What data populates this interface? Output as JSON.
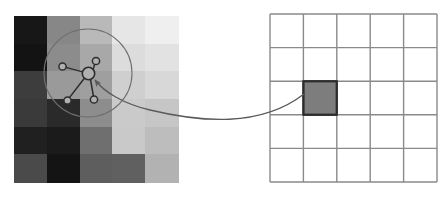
{
  "figure": {
    "title": "Pixel neighbourhood graph mapped to lattice cell",
    "width": 448,
    "height": 197,
    "background_color": "#ffffff"
  },
  "palette": {
    "stroke_dark": "#3a3a3a",
    "stroke_grid": "#808080",
    "node_fill": "#b4b4b4",
    "highlight_fill": "#7d7d7d",
    "highlight_stroke": "#2b2b2b",
    "lens_stroke": "#6e6e6e",
    "connector_stroke": "#5a5a5a"
  },
  "pixel_grid": {
    "label": "grayscale pixel patch",
    "x": 14,
    "y": 16,
    "cell_width": 32.8,
    "cell_height": 27.67,
    "columns": 5,
    "rows": 6,
    "cells": [
      [
        {
          "name": "px-r1c1",
          "color": "#171717"
        },
        {
          "name": "px-r1c2",
          "color": "#878787"
        },
        {
          "name": "px-r1c3",
          "color": "#b9b9b9"
        },
        {
          "name": "px-r1c4",
          "color": "#e6e6e6"
        },
        {
          "name": "px-r1c5",
          "color": "#efefef"
        }
      ],
      [
        {
          "name": "px-r2c1",
          "color": "#131313"
        },
        {
          "name": "px-r2c2",
          "color": "#8c8c8c"
        },
        {
          "name": "px-r2c3",
          "color": "#a8a8a8"
        },
        {
          "name": "px-r2c4",
          "color": "#dcdcdc"
        },
        {
          "name": "px-r2c5",
          "color": "#e2e2e2"
        }
      ],
      [
        {
          "name": "px-r3c1",
          "color": "#3d3d3d"
        },
        {
          "name": "px-r3c2",
          "color": "#9a9a9a"
        },
        {
          "name": "px-r3c3",
          "color": "#9f9f9f"
        },
        {
          "name": "px-r3c4",
          "color": "#cfcfcf"
        },
        {
          "name": "px-r3c5",
          "color": "#d8d8d8"
        }
      ],
      [
        {
          "name": "px-r4c1",
          "color": "#3a3a3a"
        },
        {
          "name": "px-r4c2",
          "color": "#2a2a2a"
        },
        {
          "name": "px-r4c3",
          "color": "#8d8d8d"
        },
        {
          "name": "px-r4c4",
          "color": "#cacaca"
        },
        {
          "name": "px-r4c5",
          "color": "#c6c6c6"
        }
      ],
      [
        {
          "name": "px-r5c1",
          "color": "#202020"
        },
        {
          "name": "px-r5c2",
          "color": "#1b1b1b"
        },
        {
          "name": "px-r5c3",
          "color": "#6f6f6f"
        },
        {
          "name": "px-r5c4",
          "color": "#c9c9c9"
        },
        {
          "name": "px-r5c5",
          "color": "#bdbdbd"
        }
      ],
      [
        {
          "name": "px-r6c1",
          "color": "#4a4a4a"
        },
        {
          "name": "px-r6c2",
          "color": "#141414"
        },
        {
          "name": "px-r6c3",
          "color": "#5e5e5e"
        },
        {
          "name": "px-r6c4",
          "color": "#606060"
        },
        {
          "name": "px-r6c5",
          "color": "#b2b2b2"
        }
      ]
    ]
  },
  "lens": {
    "label": "magnifier circle",
    "cx": 88,
    "cy": 73,
    "r": 44,
    "stroke": "#6e6e6e",
    "stroke_width": 1.1
  },
  "graph": {
    "label": "pixel neighbourhood graph",
    "center_node": {
      "name": "center-node",
      "cx": 88.5,
      "cy": 73.5,
      "r": 6.2
    },
    "nodes": [
      {
        "name": "neighbour-node-upper-left",
        "cx": 62.5,
        "cy": 66.5,
        "r": 3.6
      },
      {
        "name": "neighbour-node-upper-right",
        "cx": 96.0,
        "cy": 61.0,
        "r": 3.6
      },
      {
        "name": "neighbour-node-lower-left",
        "cx": 67.5,
        "cy": 100.5,
        "r": 3.6
      },
      {
        "name": "neighbour-node-lower-right",
        "cx": 94.0,
        "cy": 99.5,
        "r": 3.6
      }
    ],
    "edges": [
      {
        "name": "edge-center-upper-left",
        "x1": 82.6,
        "y1": 71.9,
        "x2": 66.0,
        "y2": 67.4
      },
      {
        "name": "edge-center-upper-right",
        "x1": 93.0,
        "y1": 70.0,
        "x2": 94.6,
        "y2": 64.4
      },
      {
        "name": "edge-center-lower-left",
        "x1": 84.0,
        "y1": 78.7,
        "x2": 69.6,
        "y2": 97.4
      },
      {
        "name": "edge-center-lower-right",
        "x1": 90.5,
        "y1": 79.5,
        "x2": 93.4,
        "y2": 96.0
      }
    ],
    "node_stroke": "#2d2d2d",
    "node_fill": "#b0b0b0",
    "edge_stroke": "#2d2d2d",
    "edge_width": 1.5
  },
  "connector": {
    "label": "correspondence arrow from graph to lattice cell",
    "path": "M 304 94 C 260 128, 200 122, 150 110 C 124 104, 104 92, 95 80",
    "arrow_tip": {
      "x": 93.5,
      "y": 78.5
    },
    "stroke": "#5a5a5a",
    "stroke_width": 1.3
  },
  "lattice_grid": {
    "label": "coarse lattice grid",
    "x": 270,
    "y": 14,
    "cell_width": 33.4,
    "cell_height": 33.6,
    "columns": 5,
    "rows": 5,
    "cell_fill": "#ffffff",
    "line_color": "#8a8a8a",
    "line_width": 1.4,
    "highlight": {
      "name": "highlighted-lattice-cell",
      "row": 3,
      "column": 2,
      "fill": "#7d7d7d",
      "stroke": "#2b2b2b",
      "stroke_width": 2.0
    }
  }
}
